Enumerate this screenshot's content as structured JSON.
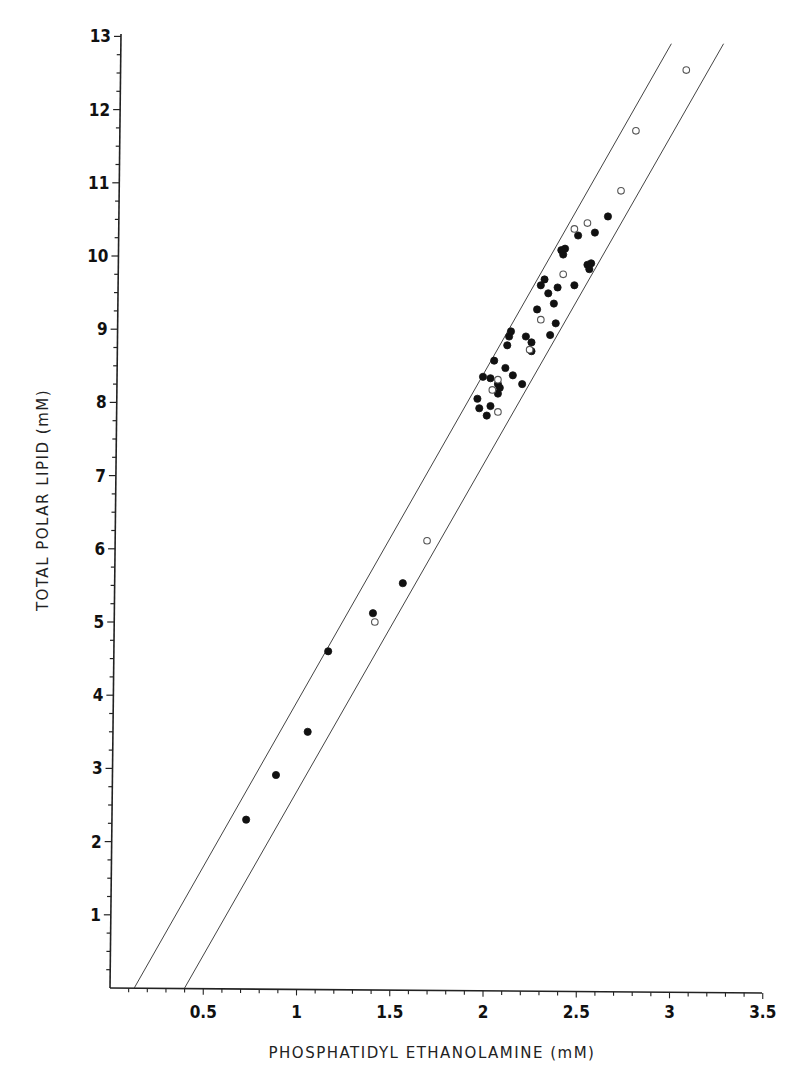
{
  "chart_data": {
    "type": "scatter",
    "title": "",
    "xlabel": "PHOSPHATIDYL ETHANOLAMINE (mM)",
    "ylabel": "TOTAL POLAR LIPID (mM)",
    "xlim": [
      0,
      3.5
    ],
    "ylim": [
      0,
      13
    ],
    "grid": false,
    "legend": "none",
    "x_ticks": [
      "0.5",
      "1",
      "1.5",
      "2",
      "2.5",
      "3",
      "3.5"
    ],
    "x_tick_values": [
      0.5,
      1,
      1.5,
      2,
      2.5,
      3,
      3.5
    ],
    "y_ticks": [
      "1",
      "2",
      "3",
      "4",
      "5",
      "6",
      "7",
      "8",
      "9",
      "10",
      "11",
      "12",
      "13"
    ],
    "y_tick_values": [
      1,
      2,
      3,
      4,
      5,
      6,
      7,
      8,
      9,
      10,
      11,
      12,
      13
    ],
    "series": [
      {
        "name": "filled",
        "marker": "filled-circle",
        "points": [
          [
            0.73,
            2.3
          ],
          [
            0.89,
            2.91
          ],
          [
            1.06,
            3.5
          ],
          [
            1.17,
            4.6
          ],
          [
            1.41,
            5.12
          ],
          [
            1.57,
            5.53
          ],
          [
            1.97,
            8.05
          ],
          [
            1.98,
            7.92
          ],
          [
            2.0,
            8.35
          ],
          [
            2.02,
            7.82
          ],
          [
            2.04,
            8.33
          ],
          [
            2.04,
            7.95
          ],
          [
            2.06,
            8.57
          ],
          [
            2.08,
            8.25
          ],
          [
            2.08,
            8.12
          ],
          [
            2.09,
            8.2
          ],
          [
            2.12,
            8.47
          ],
          [
            2.13,
            8.78
          ],
          [
            2.14,
            8.9
          ],
          [
            2.15,
            8.97
          ],
          [
            2.16,
            8.37
          ],
          [
            2.21,
            8.25
          ],
          [
            2.23,
            8.9
          ],
          [
            2.26,
            8.82
          ],
          [
            2.26,
            8.7
          ],
          [
            2.29,
            9.27
          ],
          [
            2.31,
            9.6
          ],
          [
            2.33,
            9.68
          ],
          [
            2.35,
            9.49
          ],
          [
            2.36,
            8.92
          ],
          [
            2.38,
            9.35
          ],
          [
            2.39,
            9.08
          ],
          [
            2.4,
            9.57
          ],
          [
            2.42,
            10.08
          ],
          [
            2.43,
            10.02
          ],
          [
            2.44,
            10.1
          ],
          [
            2.49,
            9.6
          ],
          [
            2.51,
            10.28
          ],
          [
            2.56,
            9.88
          ],
          [
            2.57,
            9.82
          ],
          [
            2.58,
            9.9
          ],
          [
            2.6,
            10.32
          ],
          [
            2.67,
            10.54
          ]
        ]
      },
      {
        "name": "open",
        "marker": "open-circle",
        "points": [
          [
            1.42,
            5.0
          ],
          [
            1.7,
            6.11
          ],
          [
            2.05,
            8.17
          ],
          [
            2.08,
            8.31
          ],
          [
            2.08,
            7.87
          ],
          [
            2.25,
            8.72
          ],
          [
            2.31,
            9.13
          ],
          [
            2.43,
            9.75
          ],
          [
            2.49,
            10.37
          ],
          [
            2.56,
            10.45
          ],
          [
            2.74,
            10.89
          ],
          [
            2.82,
            11.71
          ],
          [
            3.09,
            12.54
          ]
        ]
      }
    ],
    "bounding_lines": [
      {
        "name": "upper-bound-line",
        "from": [
          0.13,
          0
        ],
        "to": [
          3.01,
          12.9
        ]
      },
      {
        "name": "lower-bound-line",
        "from": [
          0.4,
          0
        ],
        "to": [
          3.29,
          12.9
        ]
      }
    ]
  }
}
